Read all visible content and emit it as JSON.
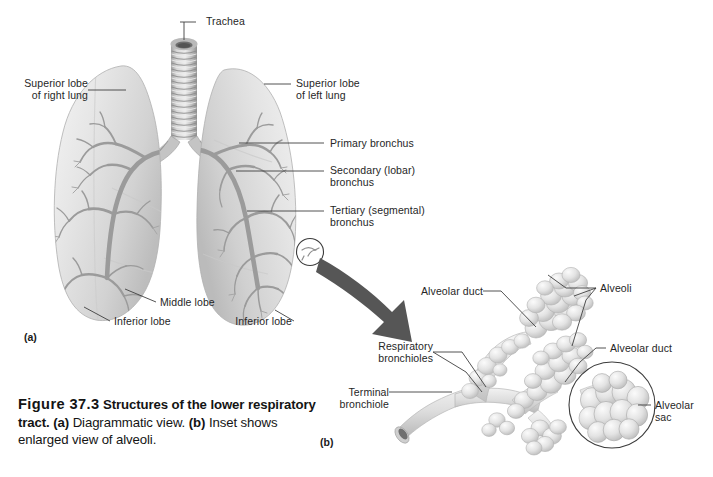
{
  "figure": {
    "number": "Figure 37.3",
    "title_bold": "Structures of the lower respiratory tract.",
    "part_a_tag": "(a)",
    "part_a_text": "Diagrammatic view.",
    "part_b_tag": "(b)",
    "part_b_text": "Inset shows enlarged view of alveoli."
  },
  "panels": {
    "a": "(a)",
    "b": "(b)"
  },
  "labels_panel_a": [
    {
      "id": "trachea",
      "text": "Trachea"
    },
    {
      "id": "superior-lobe-right",
      "line1": "Superior lobe",
      "line2": "of right lung"
    },
    {
      "id": "superior-lobe-left",
      "line1": "Superior lobe",
      "line2": "of left lung"
    },
    {
      "id": "primary-bronchus",
      "text": "Primary bronchus"
    },
    {
      "id": "secondary-bronchus",
      "line1": "Secondary (lobar)",
      "line2": "bronchus"
    },
    {
      "id": "tertiary-bronchus",
      "line1": "Tertiary (segmental)",
      "line2": "bronchus"
    },
    {
      "id": "middle-lobe",
      "text": "Middle lobe"
    },
    {
      "id": "inferior-lobe-right",
      "text": "Inferior lobe"
    },
    {
      "id": "inferior-lobe-left",
      "text": "Inferior lobe"
    }
  ],
  "labels_panel_b": [
    {
      "id": "alveolar-duct-upper",
      "text": "Alveolar duct"
    },
    {
      "id": "alveoli",
      "text": "Alveoli"
    },
    {
      "id": "alveolar-duct-right",
      "text": "Alveolar duct"
    },
    {
      "id": "respiratory-bronchioles",
      "line1": "Respiratory",
      "line2": "bronchioles"
    },
    {
      "id": "terminal-bronchiole",
      "line1": "Terminal",
      "line2": "bronchiole"
    },
    {
      "id": "alveolar-sac",
      "line1": "Alveolar",
      "line2": "sac"
    }
  ],
  "colors": {
    "background": "#ffffff",
    "text": "#262626",
    "leader_line": "#4a4a4a",
    "tissue_light": "#e8e8e8",
    "tissue_mid": "#cfcfcf",
    "tissue_shadow": "#a8a8a8",
    "bronchus_gray": "#9a9a9a",
    "bronchus_dark": "#7d7d7d",
    "arrow_gray": "#545454"
  }
}
